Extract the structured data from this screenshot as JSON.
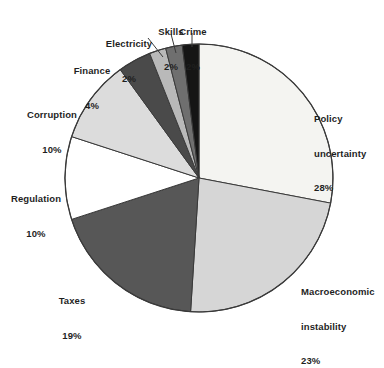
{
  "chart_data": {
    "type": "pie",
    "title": "",
    "subtitle": "",
    "xlabel": "",
    "ylabel": "",
    "legend_position": "none",
    "grid": false,
    "units": "%",
    "start_angle_deg": 0,
    "direction": "clockwise",
    "total": 100,
    "categories": [
      "Policy uncertainty",
      "Macroeconomic instability",
      "Taxes",
      "Regulation",
      "Corruption",
      "Finance",
      "Electricity",
      "Skills",
      "Crime"
    ],
    "values": [
      28,
      23,
      19,
      10,
      10,
      4,
      2,
      2,
      2
    ],
    "slices": [
      {
        "name": "Policy uncertainty",
        "value": 28,
        "value_text": "28%",
        "color": "#f4f4f1",
        "label_lines": [
          "Policy",
          "uncertainty",
          "28%"
        ]
      },
      {
        "name": "Macroeconomic instability",
        "value": 23,
        "value_text": "23%",
        "color": "#d6d6d6",
        "label_lines": [
          "Macroeconomic",
          "instability",
          "23%"
        ]
      },
      {
        "name": "Taxes",
        "value": 19,
        "value_text": "19%",
        "color": "#575757",
        "label_lines": [
          "Taxes",
          "19%"
        ]
      },
      {
        "name": "Regulation",
        "value": 10,
        "value_text": "10%",
        "color": "#ffffff",
        "label_lines": [
          "Regulation",
          "10%"
        ]
      },
      {
        "name": "Corruption",
        "value": 10,
        "value_text": "10%",
        "color": "#dcdcdc",
        "label_lines": [
          "Corruption",
          "10%"
        ]
      },
      {
        "name": "Finance",
        "value": 4,
        "value_text": "4%",
        "color": "#4a4a4a",
        "label_lines": [
          "Finance",
          "4%"
        ]
      },
      {
        "name": "Electricity",
        "value": 2,
        "value_text": "2%",
        "color": "#b9b9b9",
        "label_lines": [
          "Electricity",
          "2%"
        ]
      },
      {
        "name": "Skills",
        "value": 2,
        "value_text": "2%",
        "color": "#6f6f6f",
        "label_lines": [
          "Skills",
          "2%"
        ]
      },
      {
        "name": "Crime",
        "value": 2,
        "value_text": "2%",
        "color": "#151515",
        "label_lines": [
          "Crime",
          "2%"
        ]
      }
    ]
  },
  "labels": {
    "policy": {
      "l1": "Policy",
      "l2": "uncertainty",
      "l3": "28%"
    },
    "macro": {
      "l1": "Macroeconomic",
      "l2": "instability",
      "l3": "23%"
    },
    "taxes": {
      "l1": "Taxes",
      "l2": "19%"
    },
    "regulation": {
      "l1": "Regulation",
      "l2": "10%"
    },
    "corruption": {
      "l1": "Corruption",
      "l2": "10%"
    },
    "finance": {
      "l1": "Finance",
      "l2": "4%"
    },
    "electricity": {
      "l1": "Electricity",
      "l2": "2%"
    },
    "skills": {
      "l1": "Skills",
      "l2": "2%"
    },
    "crime": {
      "l1": "Crime",
      "l2": "2%"
    }
  },
  "style": {
    "outline_color": "#3a3a3a",
    "background": "#ffffff",
    "text_color": "#1f1f1f"
  }
}
